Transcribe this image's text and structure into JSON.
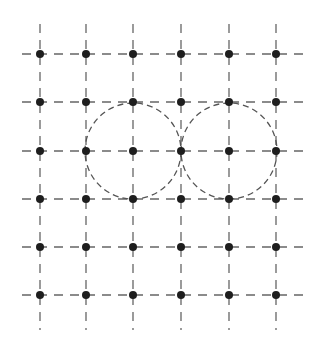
{
  "diagram": {
    "type": "square-lattice-with-circles",
    "colors": {
      "background": "#ffffff",
      "grid_line": "#666666",
      "circle": "#555555",
      "point": "#1e1e1e"
    },
    "columns_x": [
      40,
      86,
      133,
      181,
      229,
      276
    ],
    "rows_y": [
      54,
      102,
      151,
      199,
      247,
      295
    ],
    "grid_extent": {
      "x_min": 22,
      "x_max": 305,
      "y_min": 24,
      "y_max": 330
    },
    "point_radius": 4,
    "circles": [
      {
        "cx": 133,
        "cy": 151,
        "r": 48
      },
      {
        "cx": 229,
        "cy": 151,
        "r": 48
      }
    ]
  }
}
